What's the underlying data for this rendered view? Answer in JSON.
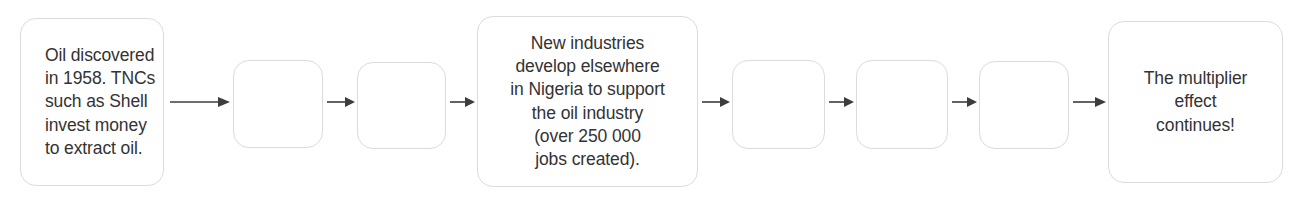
{
  "diagram": {
    "type": "flowchart",
    "orientation": "horizontal-left-to-right",
    "title": "",
    "nodes": [
      {
        "id": "node-1",
        "kind": "text-box",
        "text": "Oil discovered\nin 1958. TNCs\nsuch as Shell\ninvest money\nto extract oil.",
        "align": "left"
      },
      {
        "id": "node-2",
        "kind": "empty-box",
        "text": "",
        "align": "center"
      },
      {
        "id": "node-3",
        "kind": "empty-box",
        "text": "",
        "align": "center"
      },
      {
        "id": "node-4",
        "kind": "text-box",
        "text": "New industries\ndevelop elsewhere\nin Nigeria to support\nthe oil industry\n(over 250 000\njobs created).",
        "align": "center"
      },
      {
        "id": "node-5",
        "kind": "empty-box",
        "text": "",
        "align": "center"
      },
      {
        "id": "node-6",
        "kind": "empty-box",
        "text": "",
        "align": "center"
      },
      {
        "id": "node-7",
        "kind": "empty-box",
        "text": "",
        "align": "center"
      },
      {
        "id": "node-8",
        "kind": "text-box",
        "text": "The multiplier\neffect\ncontinues!",
        "align": "center"
      }
    ],
    "connectors": [
      {
        "id": "arrow-1",
        "icon": "arrow-right-icon",
        "from": "node-1",
        "to": "node-2"
      },
      {
        "id": "arrow-2",
        "icon": "arrow-right-icon",
        "from": "node-2",
        "to": "node-3"
      },
      {
        "id": "arrow-3",
        "icon": "arrow-right-icon",
        "from": "node-3",
        "to": "node-4"
      },
      {
        "id": "arrow-4",
        "icon": "arrow-right-icon",
        "from": "node-4",
        "to": "node-5"
      },
      {
        "id": "arrow-5",
        "icon": "arrow-right-icon",
        "from": "node-5",
        "to": "node-6"
      },
      {
        "id": "arrow-6",
        "icon": "arrow-right-icon",
        "from": "node-6",
        "to": "node-7"
      },
      {
        "id": "arrow-7",
        "icon": "arrow-right-icon",
        "from": "node-7",
        "to": "node-8"
      }
    ],
    "colors": {
      "background": "#ffffff",
      "box_border": "#dcdcdc",
      "box_fill": "#ffffff",
      "text": "#333333",
      "arrow": "#3d3d3d"
    }
  }
}
